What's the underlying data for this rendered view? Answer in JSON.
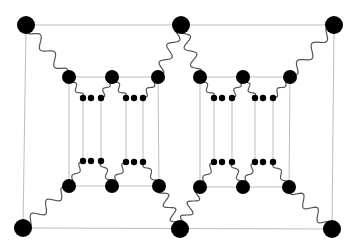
{
  "diagram": {
    "colors": {
      "node": "#000000",
      "straight_line": "#bdbdbd",
      "wavy_line": "#555555",
      "background": "#ffffff"
    },
    "outer_nodes": [
      {
        "id": "TL",
        "x": 26,
        "y": 25,
        "r": 9
      },
      {
        "id": "TM",
        "x": 181,
        "y": 25,
        "r": 9
      },
      {
        "id": "TR",
        "x": 334,
        "y": 25,
        "r": 9
      },
      {
        "id": "BL",
        "x": 23,
        "y": 228,
        "r": 9
      },
      {
        "id": "BM",
        "x": 180,
        "y": 229,
        "r": 9
      },
      {
        "id": "BR",
        "x": 332,
        "y": 229,
        "r": 9
      }
    ],
    "inner_nodes": [
      {
        "id": "L1t",
        "x": 69,
        "y": 77,
        "r": 7
      },
      {
        "id": "L2t",
        "x": 112,
        "y": 77,
        "r": 7
      },
      {
        "id": "L3t",
        "x": 158,
        "y": 77,
        "r": 7
      },
      {
        "id": "L1b",
        "x": 69,
        "y": 186,
        "r": 7
      },
      {
        "id": "L2b",
        "x": 112,
        "y": 186,
        "r": 7
      },
      {
        "id": "L3b",
        "x": 159,
        "y": 186,
        "r": 7
      },
      {
        "id": "R1t",
        "x": 200,
        "y": 77,
        "r": 7
      },
      {
        "id": "R2t",
        "x": 243,
        "y": 77,
        "r": 7
      },
      {
        "id": "R3t",
        "x": 290,
        "y": 77,
        "r": 7
      },
      {
        "id": "R1b",
        "x": 200,
        "y": 187,
        "r": 7
      },
      {
        "id": "R2b",
        "x": 243,
        "y": 187,
        "r": 7
      },
      {
        "id": "R3b",
        "x": 289,
        "y": 187,
        "r": 7
      }
    ],
    "small_nodes": [
      {
        "x": 83,
        "y": 98
      },
      {
        "x": 91,
        "y": 98
      },
      {
        "x": 101,
        "y": 98
      },
      {
        "x": 126,
        "y": 98
      },
      {
        "x": 134,
        "y": 98
      },
      {
        "x": 143,
        "y": 98
      },
      {
        "x": 83,
        "y": 161
      },
      {
        "x": 91,
        "y": 161
      },
      {
        "x": 101,
        "y": 161
      },
      {
        "x": 126,
        "y": 162
      },
      {
        "x": 134,
        "y": 162
      },
      {
        "x": 143,
        "y": 162
      },
      {
        "x": 214,
        "y": 98
      },
      {
        "x": 222,
        "y": 98
      },
      {
        "x": 232,
        "y": 98
      },
      {
        "x": 255,
        "y": 98
      },
      {
        "x": 263,
        "y": 98
      },
      {
        "x": 273,
        "y": 98
      },
      {
        "x": 214,
        "y": 162
      },
      {
        "x": 222,
        "y": 162
      },
      {
        "x": 232,
        "y": 162
      },
      {
        "x": 255,
        "y": 162
      },
      {
        "x": 263,
        "y": 162
      },
      {
        "x": 273,
        "y": 162
      }
    ],
    "straight_lines": [
      [
        26,
        25,
        334,
        25
      ],
      [
        23,
        228,
        332,
        229
      ],
      [
        26,
        25,
        23,
        228
      ],
      [
        334,
        25,
        332,
        229
      ],
      [
        69,
        77,
        158,
        77
      ],
      [
        69,
        186,
        159,
        186
      ],
      [
        69,
        77,
        69,
        186
      ],
      [
        158,
        77,
        159,
        186
      ],
      [
        200,
        77,
        290,
        77
      ],
      [
        200,
        187,
        289,
        187
      ],
      [
        200,
        77,
        200,
        187
      ],
      [
        290,
        77,
        289,
        187
      ],
      [
        83,
        98,
        83,
        161
      ],
      [
        101,
        98,
        101,
        161
      ],
      [
        126,
        98,
        126,
        162
      ],
      [
        143,
        98,
        143,
        162
      ],
      [
        214,
        98,
        214,
        162
      ],
      [
        232,
        98,
        232,
        162
      ],
      [
        255,
        98,
        255,
        162
      ],
      [
        273,
        98,
        273,
        162
      ]
    ],
    "wavy_lines": [
      {
        "from": [
          26,
          25
        ],
        "to": [
          69,
          77
        ],
        "waves": 3,
        "amp": 5
      },
      {
        "from": [
          181,
          25
        ],
        "to": [
          158,
          77
        ],
        "waves": 3,
        "amp": 5
      },
      {
        "from": [
          181,
          25
        ],
        "to": [
          200,
          77
        ],
        "waves": 3,
        "amp": 5
      },
      {
        "from": [
          334,
          25
        ],
        "to": [
          290,
          77
        ],
        "waves": 3,
        "amp": 5
      },
      {
        "from": [
          23,
          228
        ],
        "to": [
          69,
          186
        ],
        "waves": 3,
        "amp": 5
      },
      {
        "from": [
          180,
          229
        ],
        "to": [
          159,
          186
        ],
        "waves": 3,
        "amp": 5
      },
      {
        "from": [
          180,
          229
        ],
        "to": [
          200,
          187
        ],
        "waves": 3,
        "amp": 5
      },
      {
        "from": [
          332,
          229
        ],
        "to": [
          289,
          187
        ],
        "waves": 3,
        "amp": 5
      },
      {
        "from": [
          69,
          77
        ],
        "to": [
          83,
          98
        ],
        "waves": 2,
        "amp": 2.5
      },
      {
        "from": [
          112,
          77
        ],
        "to": [
          101,
          98
        ],
        "waves": 2,
        "amp": 2.5
      },
      {
        "from": [
          112,
          77
        ],
        "to": [
          126,
          98
        ],
        "waves": 2,
        "amp": 2.5
      },
      {
        "from": [
          158,
          77
        ],
        "to": [
          143,
          98
        ],
        "waves": 2,
        "amp": 2.5
      },
      {
        "from": [
          69,
          186
        ],
        "to": [
          83,
          161
        ],
        "waves": 2,
        "amp": 2.5
      },
      {
        "from": [
          112,
          186
        ],
        "to": [
          101,
          161
        ],
        "waves": 2,
        "amp": 2.5
      },
      {
        "from": [
          112,
          186
        ],
        "to": [
          126,
          162
        ],
        "waves": 2,
        "amp": 2.5
      },
      {
        "from": [
          159,
          186
        ],
        "to": [
          143,
          162
        ],
        "waves": 2,
        "amp": 2.5
      },
      {
        "from": [
          200,
          77
        ],
        "to": [
          214,
          98
        ],
        "waves": 2,
        "amp": 2.5
      },
      {
        "from": [
          243,
          77
        ],
        "to": [
          232,
          98
        ],
        "waves": 2,
        "amp": 2.5
      },
      {
        "from": [
          243,
          77
        ],
        "to": [
          255,
          98
        ],
        "waves": 2,
        "amp": 2.5
      },
      {
        "from": [
          290,
          77
        ],
        "to": [
          273,
          98
        ],
        "waves": 2,
        "amp": 2.5
      },
      {
        "from": [
          200,
          187
        ],
        "to": [
          214,
          162
        ],
        "waves": 2,
        "amp": 2.5
      },
      {
        "from": [
          243,
          187
        ],
        "to": [
          232,
          162
        ],
        "waves": 2,
        "amp": 2.5
      },
      {
        "from": [
          243,
          187
        ],
        "to": [
          255,
          162
        ],
        "waves": 2,
        "amp": 2.5
      },
      {
        "from": [
          289,
          187
        ],
        "to": [
          273,
          162
        ],
        "waves": 2,
        "amp": 2.5
      }
    ],
    "small_node_radius": 3.2
  }
}
